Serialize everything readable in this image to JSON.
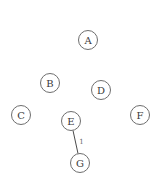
{
  "graph": {
    "node_radius": 9.5,
    "colors": {
      "background": "#ffffff",
      "node_stroke": "#6e6e6e",
      "node_fill": "#ffffff",
      "label": "#3a3a3a",
      "edge": "#4a4a4a",
      "edge_label": "#6a6a6a"
    },
    "nodes": [
      {
        "id": "A",
        "label": "A",
        "x": 88,
        "y": 40
      },
      {
        "id": "B",
        "label": "B",
        "x": 50,
        "y": 83
      },
      {
        "id": "D",
        "label": "D",
        "x": 101,
        "y": 90
      },
      {
        "id": "C",
        "label": "C",
        "x": 21,
        "y": 115
      },
      {
        "id": "E",
        "label": "E",
        "x": 71,
        "y": 121
      },
      {
        "id": "F",
        "label": "F",
        "x": 140,
        "y": 115
      },
      {
        "id": "G",
        "label": "G",
        "x": 80,
        "y": 163
      }
    ],
    "edges": [
      {
        "from": "E",
        "to": "G",
        "label": "1",
        "label_x": 81,
        "label_y": 142
      }
    ]
  }
}
